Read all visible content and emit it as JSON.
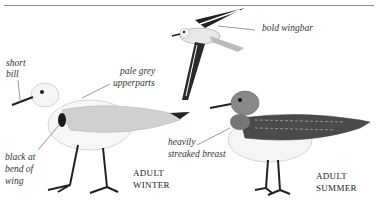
{
  "illustration": {
    "subject": "Sanderling",
    "labels": {
      "short_bill_1": "short",
      "short_bill_2": "bill",
      "pale_grey_1": "pale grey",
      "pale_grey_2": "upperparts",
      "black_bend_1": "black at",
      "black_bend_2": "bend of",
      "black_bend_3": "wing",
      "bold_wingbar": "bold wingbar",
      "streaked_1": "heavily",
      "streaked_2": "streaked breast"
    },
    "captions": {
      "winter_1": "ADULT",
      "winter_2": "WINTER",
      "summer_1": "ADULT",
      "summer_2": "SUMMER"
    },
    "colors": {
      "rule": "#8a8a8a",
      "ink": "#222222",
      "winter_grey": "#c8c8c8",
      "summer_dark": "#3a3a3a"
    }
  }
}
